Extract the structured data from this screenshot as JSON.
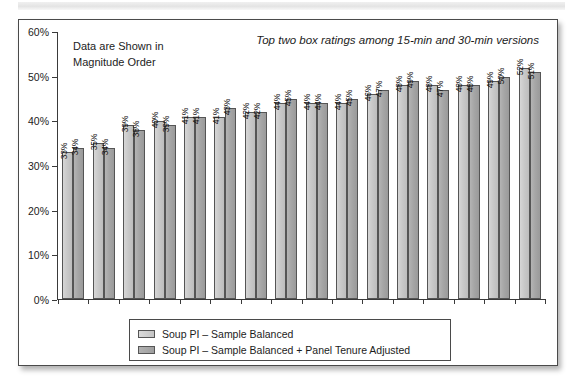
{
  "card": {
    "note": "Data are Shown in\nMagnitude Order"
  },
  "chart_data": {
    "type": "bar",
    "title": "Top two box ratings among 15-min and 30-min versions",
    "annotation": "Data are Shown in Magnitude Order",
    "xlabel": "",
    "ylabel": "",
    "ylim": [
      0,
      60
    ],
    "ytick_labels": [
      "0%",
      "10%",
      "20%",
      "30%",
      "40%",
      "50%",
      "60%"
    ],
    "ytick_values": [
      0,
      10,
      20,
      30,
      40,
      50,
      60
    ],
    "grid": false,
    "legend_position": "bottom",
    "categories": [
      "1",
      "2",
      "3",
      "4",
      "5",
      "6",
      "7",
      "8",
      "9",
      "10",
      "11",
      "12",
      "13",
      "14",
      "15",
      "16"
    ],
    "series": [
      {
        "name": "Soup PI – Sample Balanced",
        "color": "#c9c9c9",
        "values": [
          33,
          35,
          39,
          40,
          41,
          41,
          42,
          44,
          44,
          44,
          46,
          48,
          48,
          48,
          49,
          52
        ],
        "labels": [
          "33%",
          "35%",
          "39%",
          "40%",
          "41%",
          "41%",
          "42%",
          "44%",
          "44%",
          "44%",
          "46%",
          "48%",
          "48%",
          "48%",
          "49%",
          "52%"
        ]
      },
      {
        "name": "Soup PI – Sample Balanced + Panel Tenure Adjusted",
        "color": "#a6a6a6",
        "values": [
          34,
          34,
          38,
          39,
          41,
          43,
          42,
          45,
          44,
          45,
          47,
          49,
          47,
          48,
          50,
          51
        ],
        "labels": [
          "34%",
          "34%",
          "38%",
          "39%",
          "41%",
          "43%",
          "42%",
          "45%",
          "44%",
          "45%",
          "47%",
          "49%",
          "47%",
          "48%",
          "50%",
          "51%"
        ]
      }
    ]
  }
}
